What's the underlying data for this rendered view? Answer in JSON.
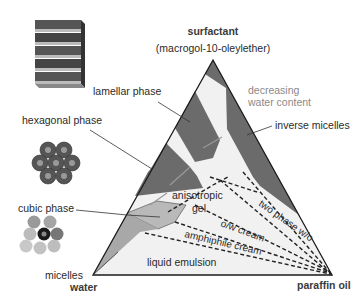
{
  "diagram": {
    "type": "ternary-phase-diagram",
    "vertices": {
      "top": {
        "label": "surfactant",
        "sublabel": "(macrogol-10-oleylether)"
      },
      "bottom_left": {
        "label": "water"
      },
      "bottom_right": {
        "label": "paraffin oil"
      }
    },
    "annotations": {
      "decreasing_line1": "decreasing",
      "decreasing_line2": "water content"
    },
    "phases": [
      {
        "id": "lamellar",
        "label": "lamellar phase",
        "color": "#6b6b6b"
      },
      {
        "id": "hexagonal",
        "label": "hexagonal phase",
        "color": "#6b6b6b"
      },
      {
        "id": "inverse",
        "label": "inverse micelles",
        "color": "#6b6b6b"
      },
      {
        "id": "cubic",
        "label": "cubic phase",
        "color": "#b9b9b9"
      },
      {
        "id": "micelles",
        "label": "micelles",
        "color": "#a8a8a8"
      },
      {
        "id": "anisotropic_line1",
        "label": "anisotropic"
      },
      {
        "id": "anisotropic_line2",
        "label": "gel"
      },
      {
        "id": "two_phase",
        "label": "two phase w/o"
      },
      {
        "id": "ow_cream",
        "label": "o/w cream"
      },
      {
        "id": "amphiphile_cream",
        "label": "amphiphile cream"
      },
      {
        "id": "liquid_emulsion",
        "label": "liquid emulsion"
      }
    ],
    "colors": {
      "dark_phase": "#6b6b6b",
      "light_phase": "#b9b9b9",
      "background_region": "#f1f1f1",
      "outline": "#1a1a1a"
    }
  }
}
